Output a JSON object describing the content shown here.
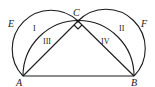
{
  "diagram": {
    "points": [
      {
        "name": "A",
        "x": 23,
        "y": 76
      },
      {
        "name": "B",
        "x": 134,
        "y": 76
      },
      {
        "name": "C",
        "x": 78,
        "y": 21
      },
      {
        "name": "E",
        "x": 12,
        "y": 26
      },
      {
        "name": "F",
        "x": 144,
        "y": 26
      }
    ],
    "labels": {
      "A": "A",
      "B": "B",
      "C": "C",
      "E": "E",
      "F": "F"
    },
    "regions": {
      "I": "I",
      "II": "II",
      "III": "III",
      "IV": "IV"
    },
    "right_angle_at": "C",
    "stroke_color": "#1a1a1a"
  }
}
